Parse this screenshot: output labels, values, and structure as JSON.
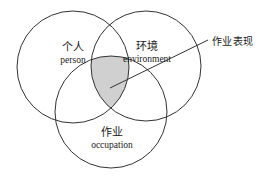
{
  "diagram": {
    "type": "venn-3-circle",
    "background_color": "#ffffff",
    "stroke_color": "#333333",
    "intersection_fill_color": "#d0d0d0",
    "text_color": "#1a1a1a",
    "circles": [
      {
        "id": "person",
        "label_cn": "个人",
        "label_en": "person",
        "cx": 73,
        "cy": 67,
        "r": 56,
        "label_x": 73,
        "label_y": 42
      },
      {
        "id": "environment",
        "label_cn": "环境",
        "label_en": "environment",
        "cx": 146,
        "cy": 66,
        "r": 55,
        "label_x": 147,
        "label_y": 41
      },
      {
        "id": "occupation",
        "label_cn": "作业",
        "label_en": "occupation",
        "cx": 111,
        "cy": 112,
        "r": 56,
        "label_x": 112,
        "label_y": 127
      }
    ],
    "callout": {
      "label": "作业表现",
      "text_x": 212,
      "text_y": 33,
      "line_x1": 110,
      "line_y1": 88,
      "line_x2": 208,
      "line_y2": 40
    }
  }
}
